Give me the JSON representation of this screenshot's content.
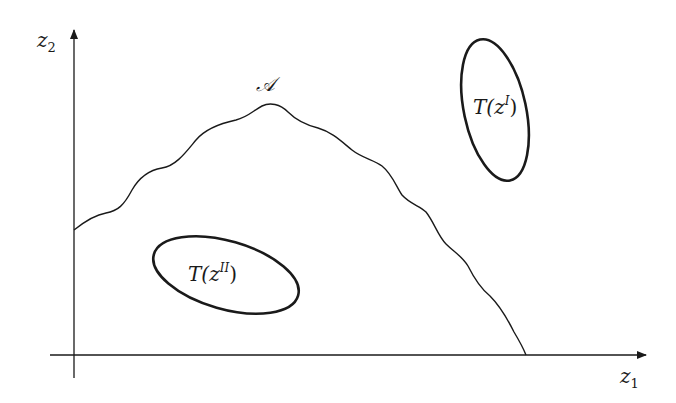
{
  "diagram": {
    "axes": {
      "x_label_var": "z",
      "x_label_sub": "1",
      "y_label_var": "z",
      "y_label_sub": "2"
    },
    "region": {
      "label": "𝒜"
    },
    "sets": [
      {
        "label_prefix": "T(",
        "label_var": "z",
        "label_sup": "I",
        "label_suffix": ")"
      },
      {
        "label_prefix": "T(",
        "label_var": "z",
        "label_sup": "II",
        "label_suffix": ")"
      }
    ],
    "colors": {
      "stroke": "#1a1a1a",
      "background": "#ffffff"
    }
  }
}
